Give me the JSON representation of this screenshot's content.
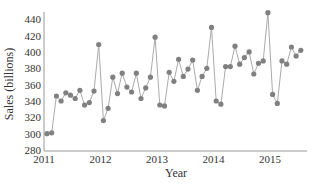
{
  "chart_data": {
    "type": "line",
    "title": "",
    "xlabel": "Year",
    "ylabel": "Sales (billions)",
    "ylim": [
      280,
      450
    ],
    "yticks": [
      280,
      300,
      320,
      340,
      360,
      380,
      400,
      420,
      440
    ],
    "xticks": [
      "2011",
      "2012",
      "2013",
      "2014",
      "2015"
    ],
    "grid": false,
    "legend": null,
    "x_start": "2011-01",
    "x_end": "2015-07",
    "frequency": "monthly",
    "series": [
      {
        "name": "Sales",
        "marker": "circle",
        "line_color": "#aaaaaa",
        "marker_color": "#808080",
        "values": [
          300,
          301,
          346,
          340,
          350,
          347,
          343,
          353,
          335,
          338,
          352,
          409,
          316,
          331,
          369,
          349,
          374,
          357,
          351,
          374,
          343,
          356,
          369,
          418,
          335,
          334,
          375,
          364,
          391,
          370,
          379,
          390,
          353,
          370,
          380,
          430,
          340,
          336,
          382,
          382,
          407,
          385,
          393,
          400,
          373,
          386,
          389,
          448,
          348,
          337,
          389,
          385,
          406,
          395,
          402
        ]
      }
    ]
  },
  "colors": {
    "axis": "#999999",
    "line": "#aaaaaa",
    "marker": "#808080",
    "text": "#333333"
  }
}
